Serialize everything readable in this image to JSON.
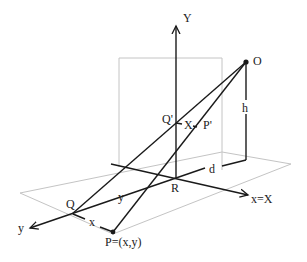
{
  "diagram": {
    "type": "perspective-projection",
    "labels": {
      "Y_axis": "Y",
      "origin_eye": "O",
      "height": "h",
      "distance": "d",
      "Q_prime": "Q'",
      "P_prime": "P'",
      "X_segment": "X",
      "R": "R",
      "x_axis": "x=X",
      "y_axis": "y",
      "y_segment": "y",
      "Q": "Q",
      "x_segment": "x",
      "P": "P=(x,y)"
    },
    "colors": {
      "ink": "#1a1a1a",
      "plane": "#c4c4c4",
      "background": "#ffffff"
    }
  }
}
